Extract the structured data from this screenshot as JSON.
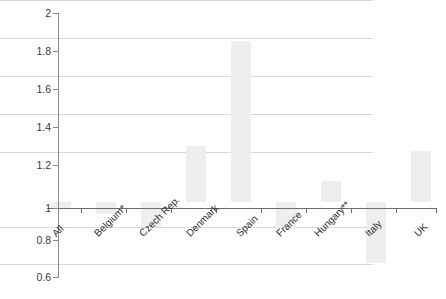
{
  "chart_data": {
    "type": "bar",
    "title": "",
    "xlabel": "",
    "ylabel": "",
    "ylim": [
      0.6,
      2
    ],
    "baseline": 1,
    "grid": true,
    "legend": "none",
    "yticks": [
      "0.6",
      "0.8",
      "1",
      "1.2",
      "1.4",
      "1.6",
      "1.8",
      "2"
    ],
    "ytick_values": [
      0.6,
      0.8,
      1.0,
      1.2,
      1.4,
      1.6,
      1.8,
      2.0
    ],
    "categories": [
      "All",
      "Belgium*",
      "Czech Rep.",
      "Denmark",
      "Spain",
      "France",
      "Hungary**",
      "Italy",
      "UK"
    ],
    "values": [
      0.97,
      0.94,
      0.87,
      1.3,
      1.85,
      0.86,
      1.11,
      0.68,
      1.27
    ],
    "bar_color": "#eeeeee",
    "grid_color": "#d9d9d9",
    "axis_color": "#6e6e6e"
  }
}
